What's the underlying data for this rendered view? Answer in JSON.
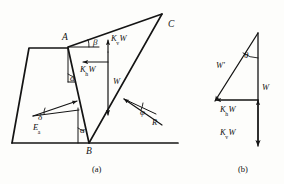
{
  "figure": {
    "panels": [
      {
        "id": "a",
        "caption": "(a)",
        "description": "Retaining wall with failure wedge ABC and applied forces"
      },
      {
        "id": "b",
        "caption": "(b)",
        "description": "Force polygon of weight and seismic inertia components"
      }
    ]
  },
  "panel_a": {
    "points": [
      {
        "name": "point-a",
        "label": "A"
      },
      {
        "name": "point-b",
        "label": "B"
      },
      {
        "name": "point-c",
        "label": "C"
      }
    ],
    "angles": [
      {
        "name": "angle-beta",
        "label": "β"
      },
      {
        "name": "angle-alpha-top",
        "label": "α"
      },
      {
        "name": "angle-alpha-bottom",
        "label": "α"
      },
      {
        "name": "angle-delta",
        "label": "δ"
      },
      {
        "name": "angle-phi",
        "label": "φ"
      }
    ],
    "forces": [
      {
        "name": "force-kv-w",
        "base": "K",
        "sub": "v",
        "tail": "W",
        "full": "KvW"
      },
      {
        "name": "force-kh-w",
        "base": "K",
        "sub": "h",
        "tail": "W",
        "full": "KhW"
      },
      {
        "name": "force-w",
        "base": "W",
        "sub": "",
        "tail": "",
        "full": "W"
      },
      {
        "name": "force-ea",
        "base": "E",
        "sub": "a",
        "tail": "",
        "full": "Ea"
      },
      {
        "name": "force-r",
        "base": "R",
        "sub": "",
        "tail": "",
        "full": "R"
      }
    ]
  },
  "panel_b": {
    "angles": [
      {
        "name": "angle-theta",
        "label": "θ"
      }
    ],
    "forces": [
      {
        "name": "force-w-prime",
        "base": "W′",
        "sub": "",
        "tail": "",
        "full": "W'"
      },
      {
        "name": "force-w",
        "base": "W",
        "sub": "",
        "tail": "",
        "full": "W"
      },
      {
        "name": "force-kh-w",
        "base": "K",
        "sub": "h",
        "tail": "W",
        "full": "KhW"
      },
      {
        "name": "force-kv-w",
        "base": "K",
        "sub": "v",
        "tail": "W",
        "full": "KvW"
      }
    ]
  },
  "style": {
    "line_color": "#141414",
    "background": "#fdfdfb"
  }
}
